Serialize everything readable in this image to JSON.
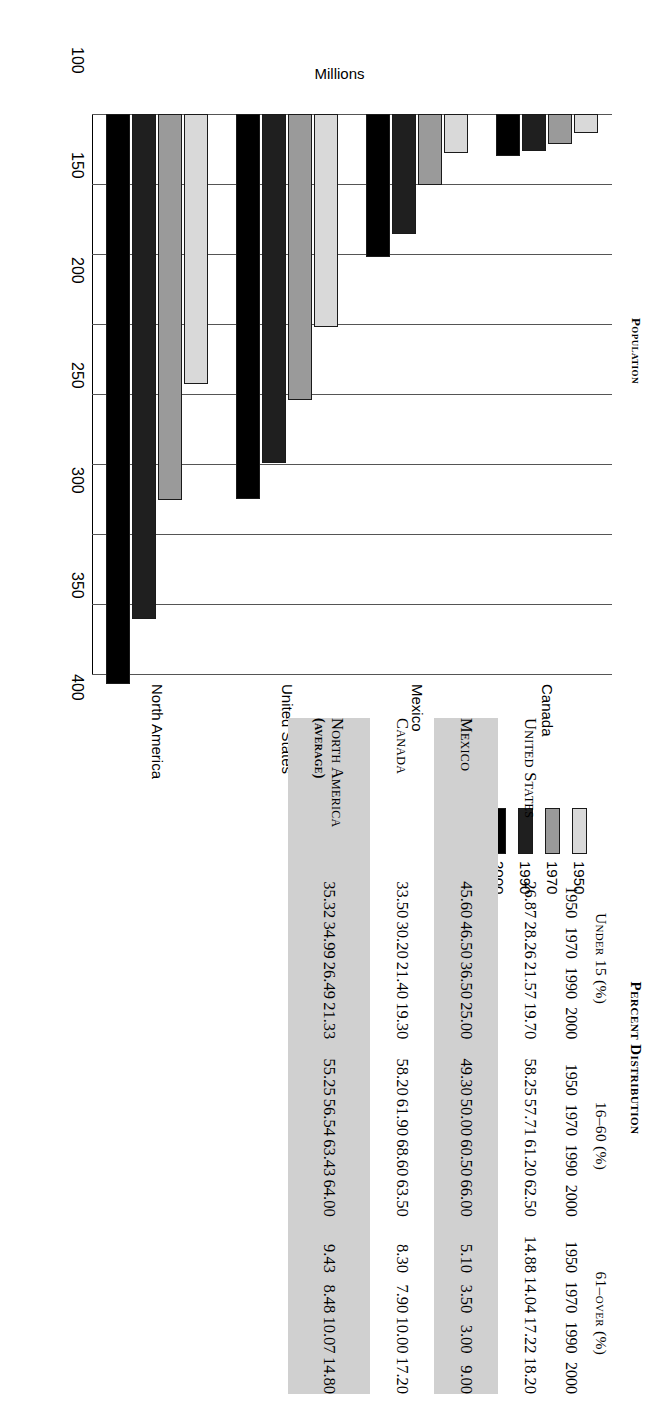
{
  "chart_data": {
    "type": "bar",
    "orientation": "horizontal",
    "title": "Population",
    "xlabel": "",
    "ylabel": "Millions",
    "ylim": [
      0,
      400
    ],
    "yticks": [
      0,
      50,
      100,
      150,
      200,
      250,
      300,
      350,
      400
    ],
    "grid": true,
    "legend_position": "bottom-right",
    "categories": [
      "Canada",
      "Mexico",
      "United States",
      "North America"
    ],
    "series": [
      {
        "name": "1950",
        "color": "#d9d9d9",
        "values": [
          13.7,
          27.7,
          152.0,
          193.0
        ]
      },
      {
        "name": "1970",
        "color": "#9a9a9a",
        "values": [
          21.3,
          50.6,
          204.0,
          276.0
        ]
      },
      {
        "name": "1990",
        "color": "#1f1f1f",
        "values": [
          26.6,
          85.5,
          249.0,
          361.0
        ]
      },
      {
        "name": "2000",
        "color": "#000000",
        "values": [
          30.0,
          102.0,
          275.0,
          407.0
        ]
      }
    ]
  },
  "chart": {
    "title": "Population",
    "axis_label": "Millions",
    "tick_labels": [
      "400",
      "350",
      "300",
      "250",
      "200",
      "150",
      "100",
      "50",
      "0"
    ],
    "category_labels": [
      "Canada",
      "Mexico",
      "United States",
      "North America"
    ],
    "legend": [
      {
        "label": "1950",
        "color": "#d9d9d9"
      },
      {
        "label": "1970",
        "color": "#9a9a9a"
      },
      {
        "label": "1990",
        "color": "#1f1f1f"
      },
      {
        "label": "2000",
        "color": "#000000"
      }
    ]
  },
  "table": {
    "title": "Percent Distribution",
    "group_headers": [
      {
        "label": "Under 15 (%)",
        "years": [
          "1950",
          "1970",
          "1990",
          "2000"
        ]
      },
      {
        "label": "16–60 (%)",
        "years": [
          "1950",
          "1970",
          "1990",
          "2000"
        ]
      },
      {
        "label": "61–over (%)",
        "years": [
          "1950",
          "1970",
          "1990",
          "2000"
        ]
      }
    ],
    "rows": [
      {
        "name": "United States",
        "sub": "",
        "shaded": false,
        "under15": [
          "26.87",
          "28.26",
          "21.57",
          "19.70"
        ],
        "mid": [
          "58.25",
          "57.71",
          "61.20",
          "62.50"
        ],
        "over61": [
          "14.88",
          "14.04",
          "17.22",
          "18.20"
        ]
      },
      {
        "name": "Mexico",
        "sub": "",
        "shaded": true,
        "under15": [
          "45.60",
          "46.50",
          "36.50",
          "25.00"
        ],
        "mid": [
          "49.30",
          "50.00",
          "60.50",
          "66.00"
        ],
        "over61": [
          "5.10",
          "3.50",
          "3.00",
          "9.00"
        ]
      },
      {
        "name": "Canada",
        "sub": "",
        "shaded": false,
        "under15": [
          "33.50",
          "30.20",
          "21.40",
          "19.30"
        ],
        "mid": [
          "58.20",
          "61.90",
          "68.60",
          "63.50"
        ],
        "over61": [
          "8.30",
          "7.90",
          "10.00",
          "17.20"
        ]
      },
      {
        "name": "North America",
        "sub": "(average)",
        "shaded": true,
        "under15": [
          "35.32",
          "34.99",
          "26.49",
          "21.33"
        ],
        "mid": [
          "55.25",
          "56.54",
          "63.43",
          "64.00"
        ],
        "over61": [
          "9.43",
          "8.48",
          "10.07",
          "14.80"
        ]
      }
    ]
  }
}
